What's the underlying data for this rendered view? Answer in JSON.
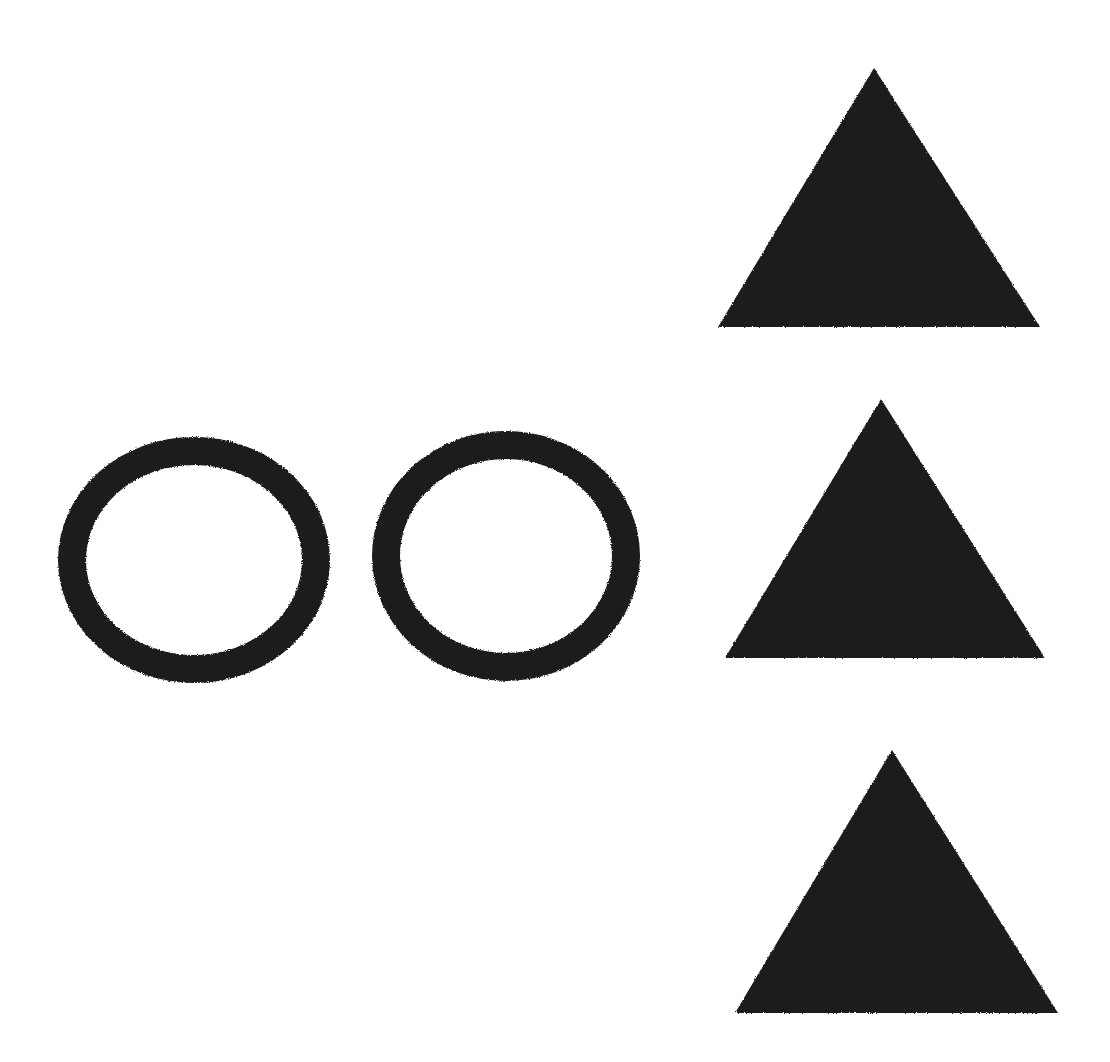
{
  "figure": {
    "canvas": {
      "width": 1110,
      "height": 1062,
      "background_color": "#ffffff"
    },
    "ink_color": "#1a1a1a",
    "shape_count_label": "5",
    "groups": [
      {
        "name": "circles-group",
        "label": "Circles",
        "count": 2,
        "fill_style": "outline"
      },
      {
        "name": "triangles-group",
        "label": "Triangles",
        "count": 3,
        "fill_style": "solid"
      }
    ]
  },
  "chart_data": {
    "type": "scatter",
    "xlabel": "",
    "ylabel": "",
    "xlim": [
      0,
      1110
    ],
    "ylim": [
      0,
      1062
    ],
    "grid": false,
    "legend": "none",
    "shapes": [
      {
        "id": "circle-1",
        "kind": "circle",
        "style": "outline",
        "color": "#1a1a1a",
        "stroke_width": 28,
        "cx": 194,
        "cy": 560,
        "rx": 136,
        "ry": 123,
        "bbox": [
          58,
          437,
          330,
          683
        ]
      },
      {
        "id": "circle-2",
        "kind": "circle",
        "style": "outline",
        "color": "#1a1a1a",
        "stroke_width": 28,
        "cx": 506,
        "cy": 556,
        "rx": 134,
        "ry": 125,
        "bbox": [
          372,
          431,
          640,
          681
        ]
      },
      {
        "id": "triangle-1",
        "kind": "triangle",
        "style": "solid",
        "color": "#1a1a1a",
        "apex": [
          874,
          68
        ],
        "base_left": [
          718,
          327
        ],
        "base_right": [
          1040,
          327
        ],
        "bbox": [
          718,
          68,
          1040,
          327
        ]
      },
      {
        "id": "triangle-2",
        "kind": "triangle",
        "style": "solid",
        "color": "#1a1a1a",
        "apex": [
          881,
          399
        ],
        "base_left": [
          725,
          658
        ],
        "base_right": [
          1045,
          658
        ],
        "bbox": [
          725,
          399,
          1045,
          658
        ]
      },
      {
        "id": "triangle-3",
        "kind": "triangle",
        "style": "solid",
        "color": "#1a1a1a",
        "apex": [
          892,
          750
        ],
        "base_left": [
          735,
          1013
        ],
        "base_right": [
          1058,
          1013
        ],
        "bbox": [
          735,
          750,
          1058,
          1013
        ]
      }
    ]
  }
}
